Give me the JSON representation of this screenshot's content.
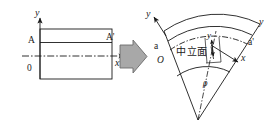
{
  "figure": {
    "background_color": "#ffffff",
    "line_color": "#1a1a1a",
    "arrow_fill_color": "#a8a8a8",
    "arrow_stroke_color": "#6b6b6b",
    "width": 275,
    "height": 127
  },
  "left_diagram": {
    "name": "undeformed-beam",
    "description": "Straight rectangular beam element with xy axes",
    "labels": {
      "y_axis": "y",
      "x_axis": "x",
      "origin": "0",
      "section_left": "A",
      "section_right": "A'"
    }
  },
  "transform_arrow": {
    "name": "transformation-arrow",
    "direction": "right",
    "glyph": "⇒"
  },
  "right_diagram": {
    "name": "deformed-beam",
    "description": "Beam bent into a circular arc sector with neutral surface marked",
    "labels": {
      "y_axis": "y",
      "x_axis": "x",
      "origin": "O",
      "section_left": "a",
      "section_right": "a'",
      "outer_y": "y",
      "inner_y": "y",
      "neutral_surface": "中立面",
      "radius": "ρ"
    }
  }
}
